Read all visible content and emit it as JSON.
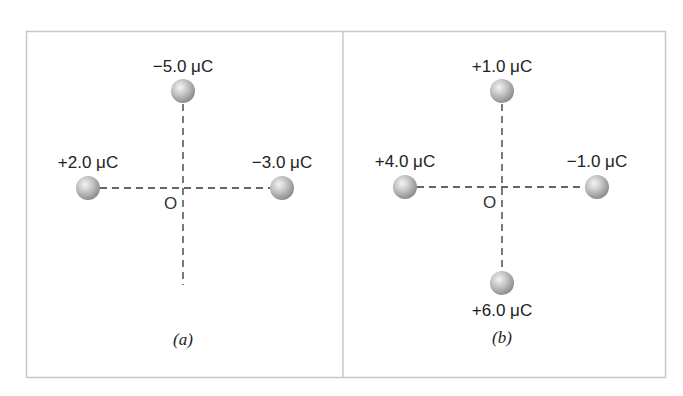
{
  "figure": {
    "frame_color": "#c8c8c8",
    "charge_fill": "#bdbdbd",
    "panels": [
      {
        "id": "a",
        "caption": "(a)",
        "origin_label": "O",
        "charges": [
          {
            "position": "top",
            "label": "−5.0 μC",
            "value_uC": -5.0
          },
          {
            "position": "left",
            "label": "+2.0 μC",
            "value_uC": 2.0
          },
          {
            "position": "right",
            "label": "−3.0 μC",
            "value_uC": -3.0
          }
        ]
      },
      {
        "id": "b",
        "caption": "(b)",
        "origin_label": "O",
        "charges": [
          {
            "position": "top",
            "label": "+1.0 μC",
            "value_uC": 1.0
          },
          {
            "position": "left",
            "label": "+4.0 μC",
            "value_uC": 4.0
          },
          {
            "position": "right",
            "label": "−1.0 μC",
            "value_uC": -1.0
          },
          {
            "position": "bottom",
            "label": "+6.0 μC",
            "value_uC": 6.0
          }
        ]
      }
    ]
  }
}
